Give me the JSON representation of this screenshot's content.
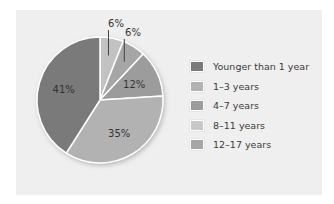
{
  "chart_data": {
    "type": "pie",
    "title": "",
    "categories": [
      "8–11 years",
      "12–17 years",
      "4–7 years",
      "1–3 years",
      "Younger than 1 year"
    ],
    "values": [
      6,
      6,
      12,
      35,
      41
    ],
    "labels": [
      "6%",
      "6%",
      "12%",
      "35%",
      "41%"
    ],
    "colors": [
      "#c2c2c2",
      "#a6a6a6",
      "#9c9c9c",
      "#b2b2b2",
      "#7a7a7a"
    ],
    "legend_position": "right",
    "legend": [
      {
        "label": "Younger than 1 year",
        "color": "#7a7a7a"
      },
      {
        "label": "1–3 years",
        "color": "#b2b2b2"
      },
      {
        "label": "4–7 years",
        "color": "#9c9c9c"
      },
      {
        "label": "8–11 years",
        "color": "#c8c8c8"
      },
      {
        "label": "12–17 years",
        "color": "#a6a6a6"
      }
    ]
  }
}
